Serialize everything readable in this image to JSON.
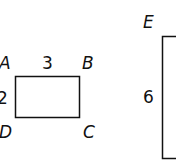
{
  "figure": {
    "rect1": {
      "vertices": [
        "A",
        "B",
        "C",
        "D"
      ],
      "width_label": "3",
      "height_label": "2"
    },
    "rect2": {
      "vertex_visible": "E",
      "height_label": "6"
    }
  },
  "labels": {
    "A": "A",
    "B": "B",
    "C": "C",
    "D": "D",
    "E": "E",
    "w1": "3",
    "h1": "2",
    "h2": "6"
  }
}
